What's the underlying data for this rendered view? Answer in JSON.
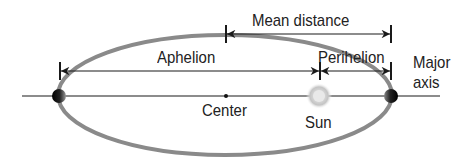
{
  "diagram": {
    "labels": {
      "mean_distance": "Mean distance",
      "aphelion": "Aphelion",
      "perihelion": "Perihelion",
      "major_axis_line1": "Major",
      "major_axis_line2": "axis",
      "center": "Center",
      "sun": "Sun"
    },
    "colors": {
      "orbit": "#8a8a8a",
      "lines": "#1a1a1a",
      "planet": "#111111",
      "sun_glow": "#c8c8c8",
      "text": "#222222"
    },
    "icons": {
      "sun": "sun-icon",
      "planet_aphelion": "planet-icon",
      "planet_perihelion": "planet-icon"
    }
  }
}
